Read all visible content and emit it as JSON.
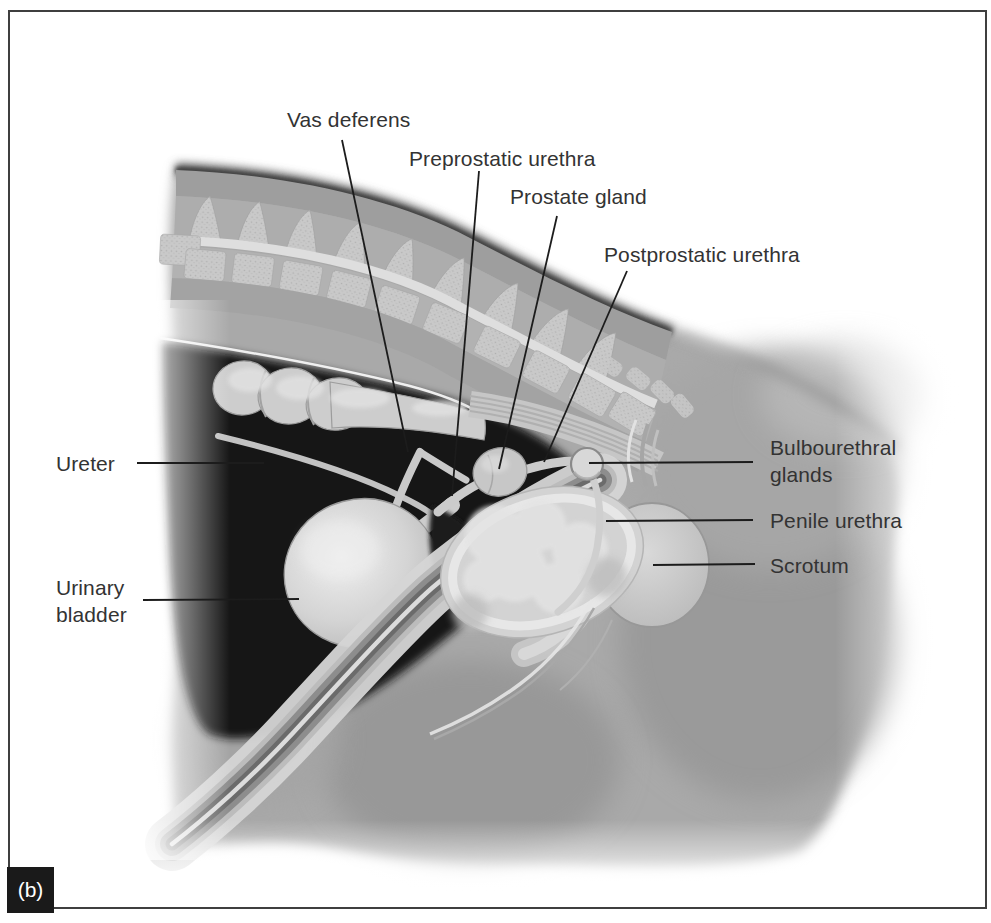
{
  "figure": {
    "panel_tag": "(b)"
  },
  "labels": {
    "vas_deferens": "Vas deferens",
    "preprostatic_urethra": "Preprostatic urethra",
    "prostate_gland": "Prostate gland",
    "postprostatic_urethra": "Postprostatic urethra",
    "ureter": "Ureter",
    "urinary_bladder": "Urinary bladder",
    "bulbourethral_glands": "Bulbourethral glands",
    "penile_urethra": "Penile urethra",
    "scrotum": "Scrotum"
  },
  "colors": {
    "background": "#ffffff",
    "frame": "#3f3f3f",
    "label_ink": "#333333",
    "leader_line": "#1c1c1c",
    "panel_tag_bg": "#1a1a1a",
    "panel_tag_text": "#ffffff",
    "body_gray": "#a9a9a9",
    "cavity_dark": "#161616",
    "organ_light": "#d3d3d3"
  }
}
